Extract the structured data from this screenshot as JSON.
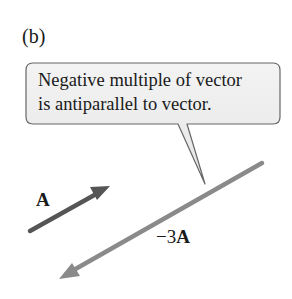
{
  "panel": {
    "label": "(b)"
  },
  "callout": {
    "line1": "Negative multiple of vector",
    "line2": "is antiparallel to vector.",
    "fill_color": "#eeeeee",
    "border_color": "#666666"
  },
  "vectors": [
    {
      "name": "A",
      "label": "A",
      "color": "#555555",
      "start": [
        30,
        231
      ],
      "end": [
        110,
        186
      ]
    },
    {
      "name": "-3A",
      "label_coef": "−3",
      "label_var": "A",
      "color": "#8a8a8a",
      "start": [
        262,
        163
      ],
      "end": [
        59,
        279
      ]
    }
  ]
}
